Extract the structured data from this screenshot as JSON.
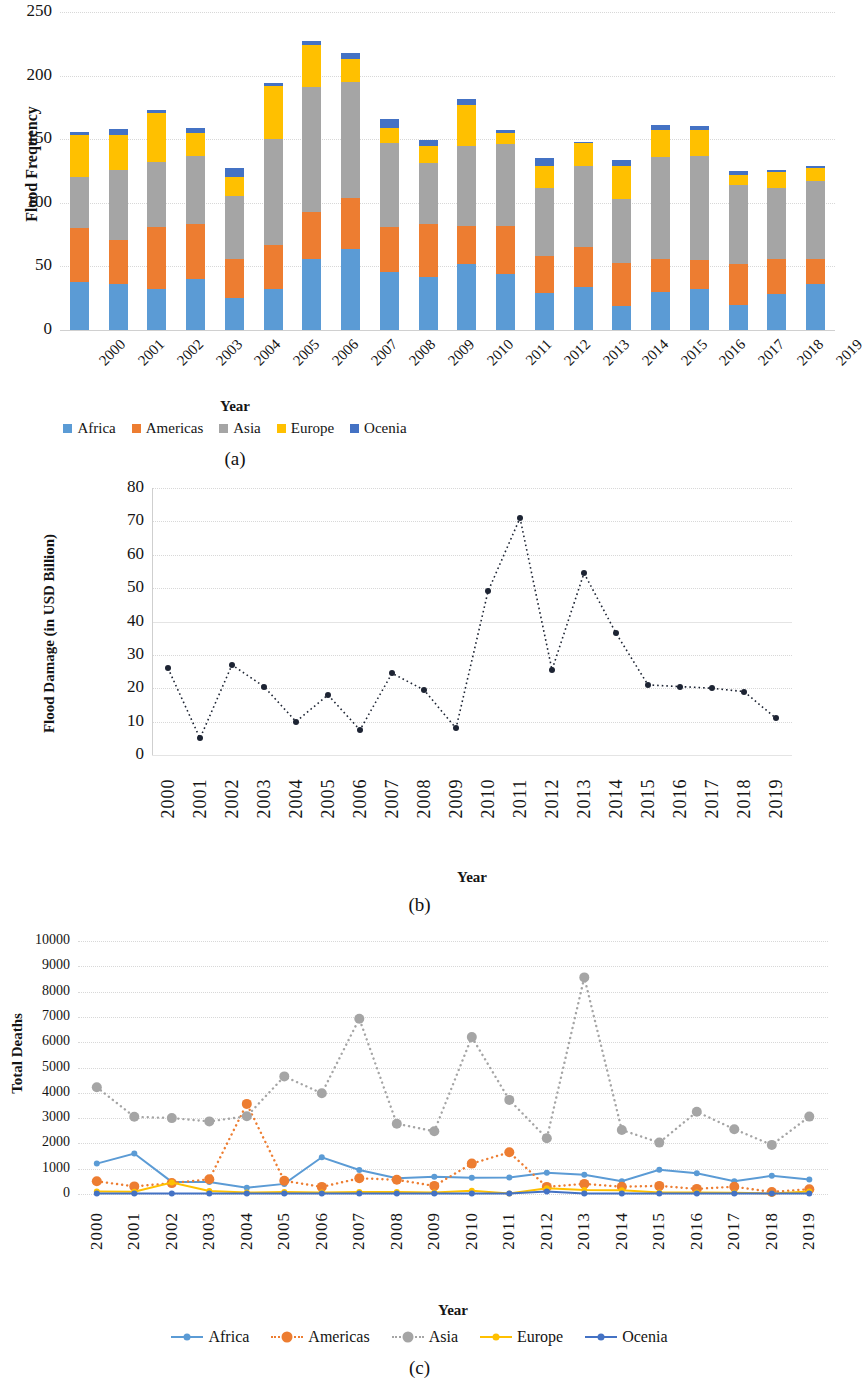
{
  "figure": {
    "panels": [
      {
        "caption": "(a)"
      },
      {
        "caption": "(b)"
      },
      {
        "caption": "(c)"
      }
    ]
  },
  "colors": {
    "africa": "#5B9BD5",
    "americas": "#ED7D31",
    "asia": "#A5A5A5",
    "europe": "#FFC000",
    "ocenia": "#4472C4",
    "damage_line": "#1d2433",
    "gridline": "#d9d9d9"
  },
  "chart_data": [
    {
      "type": "bar",
      "panel": "(a)",
      "stacked": true,
      "title": "",
      "xlabel": "Year",
      "ylabel": "Flood Frequency",
      "ylim": [
        0,
        250
      ],
      "yticks": [
        0,
        50,
        100,
        150,
        200,
        250
      ],
      "grid": true,
      "legend_position": "bottom",
      "categories": [
        "2000",
        "2001",
        "2002",
        "2003",
        "2004",
        "2005",
        "2006",
        "2007",
        "2008",
        "2009",
        "2010",
        "2011",
        "2012",
        "2013",
        "2014",
        "2015",
        "2016",
        "2017",
        "2018",
        "2019"
      ],
      "series": [
        {
          "name": "Africa",
          "color": "#5B9BD5",
          "values": [
            38,
            36,
            32,
            40,
            25,
            32,
            56,
            64,
            46,
            42,
            52,
            44,
            29,
            34,
            19,
            30,
            32,
            20,
            28,
            36
          ]
        },
        {
          "name": "Americas",
          "color": "#ED7D31",
          "values": [
            42,
            35,
            49,
            43,
            31,
            35,
            37,
            40,
            35,
            41,
            30,
            38,
            29,
            31,
            34,
            26,
            23,
            32,
            28,
            20
          ]
        },
        {
          "name": "Asia",
          "color": "#A5A5A5",
          "values": [
            40,
            55,
            51,
            54,
            49,
            83,
            98,
            91,
            66,
            48,
            63,
            64,
            54,
            64,
            50,
            80,
            82,
            62,
            56,
            61
          ]
        },
        {
          "name": "Europe",
          "color": "#FFC000",
          "values": [
            33,
            27,
            39,
            18,
            15,
            42,
            33,
            18,
            12,
            14,
            32,
            9,
            17,
            18,
            26,
            21,
            20,
            8,
            12,
            10
          ]
        },
        {
          "name": "Ocenia",
          "color": "#4472C4",
          "values": [
            3,
            5,
            2,
            4,
            7,
            2,
            3,
            5,
            7,
            4,
            5,
            2,
            6,
            1,
            5,
            4,
            3,
            3,
            2,
            2
          ]
        }
      ]
    },
    {
      "type": "line",
      "panel": "(b)",
      "title": "",
      "xlabel": "Year",
      "ylabel": "Flood Damage (in USD Billion)",
      "ylim": [
        0,
        80
      ],
      "yticks": [
        0,
        10,
        20,
        30,
        40,
        50,
        60,
        70,
        80
      ],
      "grid": true,
      "line_style": "dotted",
      "marker": "circle",
      "legend_position": "none",
      "x": [
        "2000",
        "2001",
        "2002",
        "2003",
        "2004",
        "2005",
        "2006",
        "2007",
        "2008",
        "2009",
        "2010",
        "2011",
        "2012",
        "2013",
        "2014",
        "2015",
        "2016",
        "2017",
        "2018",
        "2019"
      ],
      "values": [
        26,
        5,
        27,
        20.5,
        10,
        18,
        7.5,
        24.5,
        19.5,
        8,
        49,
        71,
        25.5,
        54.5,
        36.5,
        21,
        20.5,
        20,
        19,
        11
      ]
    },
    {
      "type": "line",
      "panel": "(c)",
      "title": "",
      "xlabel": "Year",
      "ylabel": "Total Deaths",
      "ylim": [
        0,
        10000
      ],
      "yticks": [
        0,
        1000,
        2000,
        3000,
        4000,
        5000,
        6000,
        7000,
        8000,
        9000,
        10000
      ],
      "grid": true,
      "legend_position": "bottom",
      "x": [
        "2000",
        "2001",
        "2002",
        "2003",
        "2004",
        "2005",
        "2006",
        "2007",
        "2008",
        "2009",
        "2010",
        "2011",
        "2012",
        "2013",
        "2014",
        "2015",
        "2016",
        "2017",
        "2018",
        "2019"
      ],
      "series": [
        {
          "name": "Africa",
          "color": "#5B9BD5",
          "style": "solid",
          "values": [
            1200,
            1600,
            480,
            480,
            250,
            400,
            1450,
            950,
            620,
            680,
            640,
            650,
            840,
            760,
            500,
            960,
            820,
            500,
            720,
            570
          ]
        },
        {
          "name": "Americas",
          "color": "#ED7D31",
          "style": "dotted",
          "values": [
            500,
            300,
            430,
            580,
            3560,
            520,
            280,
            620,
            560,
            320,
            1200,
            1650,
            280,
            400,
            290,
            320,
            200,
            290,
            80,
            190
          ]
        },
        {
          "name": "Asia",
          "color": "#A5A5A5",
          "style": "dotted",
          "values": [
            4220,
            3050,
            3000,
            2870,
            3070,
            4650,
            3980,
            6930,
            2780,
            2480,
            6200,
            3720,
            2200,
            8560,
            2530,
            2030,
            3250,
            2560,
            1940,
            3060
          ]
        },
        {
          "name": "Europe",
          "color": "#FFC000",
          "style": "solid",
          "values": [
            100,
            90,
            450,
            120,
            60,
            80,
            60,
            80,
            80,
            60,
            130,
            20,
            230,
            160,
            150,
            60,
            60,
            50,
            20,
            100
          ]
        },
        {
          "name": "Ocenia",
          "color": "#4472C4",
          "style": "solid",
          "values": [
            20,
            20,
            25,
            15,
            20,
            20,
            20,
            20,
            20,
            20,
            20,
            20,
            100,
            20,
            20,
            20,
            20,
            20,
            20,
            20
          ]
        }
      ]
    }
  ]
}
